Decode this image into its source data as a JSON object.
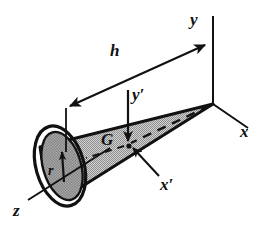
{
  "figure": {
    "type": "engineering-diagram",
    "colors": {
      "ink": "#111111",
      "cone_fill": "#b8b8b8",
      "base_fill": "#9a9a9a",
      "background": "#ffffff"
    },
    "labels": {
      "axis_y": "y",
      "axis_x": "x",
      "axis_z": "z",
      "axis_y_prime": "y′",
      "axis_x_prime": "x′",
      "height": "h",
      "radius": "r",
      "centroid": "G"
    },
    "geometry": {
      "apex": [
        213,
        104
      ],
      "base_center": [
        60,
        166
      ],
      "centroid": [
        128,
        144
      ],
      "base_radius_px": 37,
      "height_dim_from": [
        66,
        108
      ],
      "height_dim_to": [
        205,
        45
      ]
    }
  }
}
